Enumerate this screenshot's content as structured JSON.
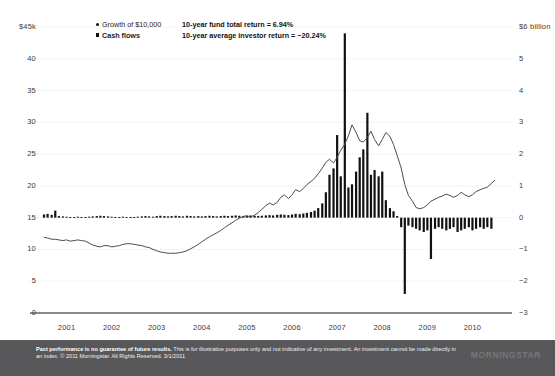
{
  "legend": {
    "series": [
      {
        "key": "growth-of-10000",
        "label": "Growth of $10,000",
        "marker": "dot",
        "bold": false
      },
      {
        "key": "cash-flows",
        "label": "Cash flows",
        "marker": "square",
        "bold": true
      }
    ],
    "stats": [
      {
        "key": "fund-total-return",
        "label": "10-year fund total return = 6.94%"
      },
      {
        "key": "average-investor-return",
        "label": "10-year average investor return = −20.24%"
      }
    ]
  },
  "footer": {
    "disclaimer_bold": "Past performance is no guarantee of future results.",
    "disclaimer_rest": " This is for illustrative purposes only and not indicative of any investment. An investment cannot be made directly in an index. © 2011 Morningstar. All Rights Reserved. 3/1/2011",
    "logo": "MORNINGSTAR",
    "background_color": "#58585a"
  },
  "chart_data": {
    "type": "line",
    "title": "",
    "subtitle": "",
    "xlabel": "",
    "ylabel": "",
    "grid": true,
    "legend_position": "top-left",
    "colors": {
      "line": "#4c4c4c",
      "bars": "#111111",
      "grid": "#c9c9c9",
      "axis": "#1a1a1a"
    },
    "x": {
      "tick_labels": [
        "2001",
        "2002",
        "2003",
        "2004",
        "2005",
        "2006",
        "2007",
        "2008",
        "2009",
        "2010"
      ],
      "range": [
        2001.0,
        2011.0
      ]
    },
    "axes": [
      {
        "id": "left",
        "name": "Growth of $10,000",
        "unit": "thousands of dollars",
        "tick_labels": [
          "$45k",
          "40",
          "35",
          "30",
          "25",
          "20",
          "15",
          "10",
          "5",
          "0"
        ],
        "ticks": [
          45,
          40,
          35,
          30,
          25,
          20,
          15,
          10,
          5,
          0
        ],
        "range": [
          0,
          45
        ]
      },
      {
        "id": "right",
        "name": "Cash flows",
        "unit": "billions of dollars",
        "tick_labels": [
          "$6 billion",
          "5",
          "4",
          "3",
          "2",
          "1",
          "0",
          "−1",
          "−2",
          "−3"
        ],
        "ticks": [
          6,
          5,
          4,
          3,
          2,
          1,
          0,
          -1,
          -2,
          -3
        ],
        "range": [
          -3,
          6
        ]
      }
    ],
    "series": [
      {
        "name": "Growth of $10,000",
        "axis": "left",
        "type": "line",
        "unit": "thousands of dollars",
        "x": [
          2001.0,
          2001.08,
          2001.17,
          2001.25,
          2001.33,
          2001.42,
          2001.5,
          2001.58,
          2001.67,
          2001.75,
          2001.83,
          2001.92,
          2002.0,
          2002.08,
          2002.17,
          2002.25,
          2002.33,
          2002.42,
          2002.5,
          2002.58,
          2002.67,
          2002.75,
          2002.83,
          2002.92,
          2003.0,
          2003.08,
          2003.17,
          2003.25,
          2003.33,
          2003.42,
          2003.5,
          2003.58,
          2003.67,
          2003.75,
          2003.83,
          2003.92,
          2004.0,
          2004.08,
          2004.17,
          2004.25,
          2004.33,
          2004.42,
          2004.5,
          2004.58,
          2004.67,
          2004.75,
          2004.83,
          2004.92,
          2005.0,
          2005.08,
          2005.17,
          2005.25,
          2005.33,
          2005.42,
          2005.5,
          2005.58,
          2005.67,
          2005.75,
          2005.83,
          2005.92,
          2006.0,
          2006.08,
          2006.17,
          2006.25,
          2006.33,
          2006.42,
          2006.5,
          2006.58,
          2006.67,
          2006.75,
          2006.83,
          2006.92,
          2007.0,
          2007.08,
          2007.17,
          2007.25,
          2007.33,
          2007.42,
          2007.5,
          2007.58,
          2007.67,
          2007.75,
          2007.83,
          2007.92,
          2008.0,
          2008.08,
          2008.17,
          2008.25,
          2008.33,
          2008.42,
          2008.5,
          2008.58,
          2008.67,
          2008.75,
          2008.83,
          2008.92,
          2009.0,
          2009.08,
          2009.17,
          2009.25,
          2009.33,
          2009.42,
          2009.5,
          2009.58,
          2009.67,
          2009.75,
          2009.83,
          2009.92,
          2010.0,
          2010.08,
          2010.17,
          2010.25,
          2010.33,
          2010.42,
          2010.5,
          2010.58,
          2010.67,
          2010.75,
          2010.83,
          2010.92,
          2011.0
        ],
        "y": [
          11.9,
          11.8,
          11.6,
          11.6,
          11.5,
          11.4,
          11.5,
          11.3,
          11.4,
          11.5,
          11.4,
          11.3,
          11.0,
          10.7,
          10.5,
          10.4,
          10.6,
          10.6,
          10.4,
          10.5,
          10.6,
          10.8,
          10.9,
          10.9,
          10.8,
          10.7,
          10.6,
          10.4,
          10.3,
          10.0,
          9.8,
          9.6,
          9.5,
          9.4,
          9.4,
          9.4,
          9.5,
          9.6,
          9.8,
          10.1,
          10.4,
          10.8,
          11.2,
          11.6,
          12.0,
          12.3,
          12.6,
          13.0,
          13.4,
          13.8,
          14.2,
          14.6,
          14.9,
          15.2,
          15.3,
          15.1,
          15.4,
          15.8,
          16.3,
          16.9,
          17.3,
          17.0,
          17.4,
          18.2,
          18.6,
          18.0,
          18.6,
          19.4,
          19.1,
          19.6,
          20.2,
          20.7,
          21.2,
          21.9,
          22.8,
          23.7,
          24.2,
          23.6,
          24.5,
          25.6,
          26.6,
          27.9,
          29.6,
          28.4,
          27.1,
          26.9,
          27.6,
          28.6,
          27.3,
          26.3,
          27.3,
          28.4,
          27.8,
          26.5,
          24.8,
          22.8,
          20.2,
          18.5,
          17.6,
          16.6,
          16.4,
          16.6,
          17.0,
          17.6,
          17.9,
          18.2,
          18.4,
          18.7,
          18.5,
          18.2,
          18.5,
          19.0,
          18.6,
          18.3,
          18.6,
          19.1,
          19.4,
          19.6,
          19.8,
          20.4,
          20.9
        ]
      },
      {
        "name": "Cash flows",
        "axis": "right",
        "type": "bar",
        "unit": "billions of dollars",
        "x": [
          2001.0,
          2001.08,
          2001.17,
          2001.25,
          2001.33,
          2001.42,
          2001.5,
          2001.58,
          2001.67,
          2001.75,
          2001.83,
          2001.92,
          2002.0,
          2002.08,
          2002.17,
          2002.25,
          2002.33,
          2002.42,
          2002.5,
          2002.58,
          2002.67,
          2002.75,
          2002.83,
          2002.92,
          2003.0,
          2003.08,
          2003.17,
          2003.25,
          2003.33,
          2003.42,
          2003.5,
          2003.58,
          2003.67,
          2003.75,
          2003.83,
          2003.92,
          2004.0,
          2004.08,
          2004.17,
          2004.25,
          2004.33,
          2004.42,
          2004.5,
          2004.58,
          2004.67,
          2004.75,
          2004.83,
          2004.92,
          2005.0,
          2005.08,
          2005.17,
          2005.25,
          2005.33,
          2005.42,
          2005.5,
          2005.58,
          2005.67,
          2005.75,
          2005.83,
          2005.92,
          2006.0,
          2006.08,
          2006.17,
          2006.25,
          2006.33,
          2006.42,
          2006.5,
          2006.58,
          2006.67,
          2006.75,
          2006.83,
          2006.92,
          2007.0,
          2007.08,
          2007.17,
          2007.25,
          2007.33,
          2007.42,
          2007.5,
          2007.58,
          2007.67,
          2007.75,
          2007.83,
          2007.92,
          2008.0,
          2008.08,
          2008.17,
          2008.25,
          2008.33,
          2008.42,
          2008.5,
          2008.58,
          2008.67,
          2008.75,
          2008.83,
          2008.92,
          2009.0,
          2009.08,
          2009.17,
          2009.25,
          2009.33,
          2009.42,
          2009.5,
          2009.58,
          2009.67,
          2009.75,
          2009.83,
          2009.92,
          2010.0,
          2010.08,
          2010.17,
          2010.25,
          2010.33,
          2010.42,
          2010.5,
          2010.58,
          2010.67,
          2010.75,
          2010.83,
          2010.92
        ],
        "y": [
          0.1,
          0.12,
          0.09,
          0.22,
          0.05,
          0.04,
          0.03,
          0.02,
          0.02,
          0.03,
          0.02,
          0.02,
          0.03,
          0.04,
          0.05,
          0.06,
          0.05,
          0.04,
          0.03,
          0.02,
          0.02,
          0.03,
          0.02,
          0.02,
          0.02,
          0.03,
          0.04,
          0.05,
          0.04,
          0.03,
          0.05,
          0.06,
          0.05,
          0.04,
          0.05,
          0.06,
          0.05,
          0.04,
          0.06,
          0.05,
          0.04,
          0.05,
          0.04,
          0.05,
          0.06,
          0.05,
          0.04,
          0.05,
          0.06,
          0.05,
          0.06,
          0.07,
          0.06,
          0.05,
          0.06,
          0.07,
          0.06,
          0.05,
          0.06,
          0.07,
          0.08,
          0.07,
          0.09,
          0.1,
          0.09,
          0.08,
          0.1,
          0.12,
          0.11,
          0.13,
          0.15,
          0.18,
          0.22,
          0.3,
          0.45,
          0.8,
          1.35,
          1.55,
          2.6,
          1.3,
          5.8,
          0.95,
          1.05,
          1.45,
          1.9,
          2.15,
          3.3,
          1.35,
          1.5,
          1.3,
          1.45,
          0.55,
          0.3,
          0.2,
          0.05,
          -0.3,
          -2.4,
          -0.25,
          -0.3,
          -0.35,
          -0.4,
          -0.45,
          -0.4,
          -1.3,
          -0.35,
          -0.3,
          -0.35,
          -0.4,
          -0.35,
          -0.3,
          -0.45,
          -0.4,
          -0.35,
          -0.3,
          -0.4,
          -0.35,
          -0.3,
          -0.35,
          -0.3,
          -0.35
        ]
      }
    ],
    "annotations": [
      {
        "key": "fund-total-return",
        "text": "10-year fund total return = 6.94%"
      },
      {
        "key": "average-investor-return",
        "text": "10-year average investor return = −20.24%"
      }
    ]
  }
}
